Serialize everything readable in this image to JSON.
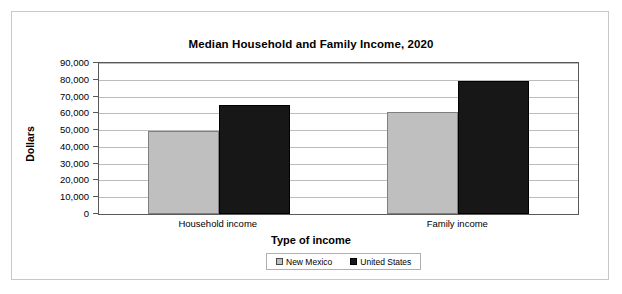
{
  "chart_data": {
    "type": "bar",
    "title": "Median Household and Family Income, 2020",
    "xlabel": "Type of income",
    "ylabel": "Dollars",
    "categories": [
      "Household income",
      "Family income"
    ],
    "series": [
      {
        "name": "New Mexico",
        "color": "#bfbfbf",
        "values": [
          49500,
          61000
        ]
      },
      {
        "name": "United States",
        "color": "#171717",
        "values": [
          65000,
          79500
        ]
      }
    ],
    "ylim": [
      0,
      90000
    ],
    "ytick_labels": [
      "90,000",
      "80,000",
      "70,000",
      "60,000",
      "50,000",
      "40,000",
      "30,000",
      "20,000",
      "10,000",
      "0"
    ],
    "ytick_values": [
      90000,
      80000,
      70000,
      60000,
      50000,
      40000,
      30000,
      20000,
      10000,
      0
    ],
    "grid": true,
    "legend_position": "bottom"
  },
  "legend": {
    "items": [
      {
        "label": "New Mexico"
      },
      {
        "label": "United States"
      }
    ]
  }
}
